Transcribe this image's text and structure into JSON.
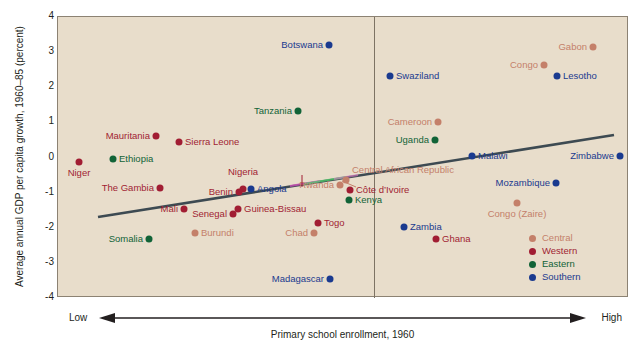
{
  "chart_data": {
    "type": "scatter",
    "title": "",
    "xlabel": "Primary school enrollment, 1960",
    "ylabel": "Average annual GDP per capita growth, 1960–85 (percent)",
    "x_axis_low_label": "Low",
    "x_axis_high_label": "High",
    "x_axis_kind": "ordinal-arrow",
    "grid": false,
    "ylim": [
      -4,
      4
    ],
    "y_ticks": [
      "4",
      "3",
      "2",
      "1",
      "0",
      "-1",
      "-2",
      "-3",
      "-4"
    ],
    "legend_position": "inside-bottom-right",
    "annotations": [
      {
        "name": "median-divider",
        "kind": "vertical-line",
        "x_px": 316
      },
      {
        "name": "regression-line",
        "kind": "trend-line",
        "slope": "positive"
      }
    ],
    "series": [
      {
        "name": "Central",
        "color": "#c4806a",
        "points": [
          {
            "label": "Rwanda",
            "x_px": 339,
            "y_px": 184,
            "value_y": -0.8,
            "label_pos": "left"
          },
          {
            "label": "Central African Republic",
            "x_px": 345,
            "y_px": 179,
            "value_y": -0.7,
            "label_pos": "right-up"
          },
          {
            "label": "Cameroon",
            "x_px": 437,
            "y_px": 121,
            "value_y": 1.0,
            "label_pos": "left"
          },
          {
            "label": "Chad",
            "x_px": 313,
            "y_px": 232,
            "value_y": -2.2,
            "label_pos": "left"
          },
          {
            "label": "Burundi",
            "x_px": 194,
            "y_px": 232,
            "value_y": -2.2,
            "label_pos": "right"
          },
          {
            "label": "Gabon",
            "x_px": 592,
            "y_px": 46,
            "value_y": 3.15,
            "label_pos": "left"
          },
          {
            "label": "Congo",
            "x_px": 543,
            "y_px": 64,
            "value_y": 2.6,
            "label_pos": "left"
          },
          {
            "label": "Congo (Zaire)",
            "x_px": 516,
            "y_px": 202,
            "value_y": -1.5,
            "label_pos": "below"
          }
        ]
      },
      {
        "name": "Western",
        "color": "#a11d33",
        "points": [
          {
            "label": "Niger",
            "x_px": 78,
            "y_px": 161,
            "value_y": -0.1,
            "label_pos": "below"
          },
          {
            "label": "Mauritania",
            "x_px": 155,
            "y_px": 135,
            "value_y": 0.65,
            "label_pos": "left"
          },
          {
            "label": "Sierra Leone",
            "x_px": 178,
            "y_px": 141,
            "value_y": 0.5,
            "label_pos": "right"
          },
          {
            "label": "The Gambia",
            "x_px": 159,
            "y_px": 187,
            "value_y": -0.9,
            "label_pos": "left"
          },
          {
            "label": "Nigeria",
            "x_px": 242,
            "y_px": 188,
            "value_y": -0.92,
            "label_pos": "above"
          },
          {
            "label": "Benin",
            "x_px": 238,
            "y_px": 191,
            "value_y": -1.0,
            "label_pos": "left"
          },
          {
            "label": "Mali",
            "x_px": 183,
            "y_px": 208,
            "value_y": -1.5,
            "label_pos": "left"
          },
          {
            "label": "Senegal",
            "x_px": 232,
            "y_px": 213,
            "value_y": -1.65,
            "label_pos": "left"
          },
          {
            "label": "Guinea-Bissau",
            "x_px": 237,
            "y_px": 208,
            "value_y": -1.5,
            "label_pos": "right"
          },
          {
            "label": "Togo",
            "x_px": 317,
            "y_px": 222,
            "value_y": -1.9,
            "label_pos": "right"
          },
          {
            "label": "Côte d’Ivoire",
            "x_px": 349,
            "y_px": 189,
            "value_y": -0.95,
            "label_pos": "right"
          },
          {
            "label": "Ghana",
            "x_px": 435,
            "y_px": 238,
            "value_y": -2.4,
            "label_pos": "right"
          }
        ]
      },
      {
        "name": "Eastern",
        "color": "#116337",
        "points": [
          {
            "label": "Ethiopia",
            "x_px": 112,
            "y_px": 158,
            "value_y": 0.0,
            "label_pos": "right"
          },
          {
            "label": "Somalia",
            "x_px": 148,
            "y_px": 238,
            "value_y": -2.4,
            "label_pos": "left"
          },
          {
            "label": "Kenya",
            "x_px": 348,
            "y_px": 199,
            "value_y": -1.25,
            "label_pos": "right"
          },
          {
            "label": "Tanzania",
            "x_px": 297,
            "y_px": 110,
            "value_y": 1.35,
            "label_pos": "left"
          },
          {
            "label": "Uganda",
            "x_px": 434,
            "y_px": 139,
            "value_y": 0.55,
            "label_pos": "left"
          }
        ]
      },
      {
        "name": "Southern",
        "color": "#1a3a8f",
        "points": [
          {
            "label": "Angola",
            "x_px": 250,
            "y_px": 188,
            "value_y": -0.9,
            "label_pos": "right"
          },
          {
            "label": "Botswana",
            "x_px": 328,
            "y_px": 44,
            "value_y": 3.2,
            "label_pos": "left"
          },
          {
            "label": "Madagascar",
            "x_px": 329,
            "y_px": 278,
            "value_y": -3.35,
            "label_pos": "left"
          },
          {
            "label": "Swaziland",
            "x_px": 389,
            "y_px": 75,
            "value_y": 2.45,
            "label_pos": "right"
          },
          {
            "label": "Lesotho",
            "x_px": 556,
            "y_px": 75,
            "value_y": 2.45,
            "label_pos": "right"
          },
          {
            "label": "Malawi",
            "x_px": 471,
            "y_px": 155,
            "value_y": 0.1,
            "label_pos": "right"
          },
          {
            "label": "Zimbabwe",
            "x_px": 619,
            "y_px": 155,
            "value_y": 0.1,
            "label_pos": "left"
          },
          {
            "label": "Mozambique",
            "x_px": 555,
            "y_px": 182,
            "value_y": -0.75,
            "label_pos": "left"
          },
          {
            "label": "Zambia",
            "x_px": 403,
            "y_px": 226,
            "value_y": -2.0,
            "label_pos": "right"
          }
        ]
      }
    ]
  },
  "legend": {
    "items": [
      {
        "label": "Central",
        "color": "#c4806a"
      },
      {
        "label": "Western",
        "color": "#a11d33"
      },
      {
        "label": "Eastern",
        "color": "#116337"
      },
      {
        "label": "Southern",
        "color": "#1a3a8f"
      }
    ]
  },
  "colors": {
    "plot_background": "#e8ddcb",
    "frame": "#8c8273",
    "trend_line": "#3d4a52",
    "divider": "#7d7364",
    "text": "#231f20"
  }
}
